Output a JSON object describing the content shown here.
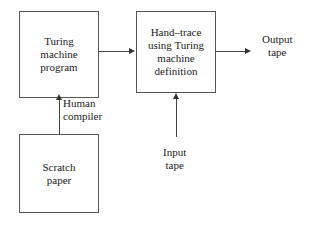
{
  "diagram": {
    "background_color": "#ffffff",
    "line_color": "#444444",
    "text_color": "#222222",
    "boxes": [
      {
        "id": "turing-machine-program",
        "lines": [
          "Turing",
          "machine",
          "program"
        ]
      },
      {
        "id": "hand-trace",
        "lines": [
          "Hand–trace",
          "using Turing",
          "machine",
          "definition"
        ]
      },
      {
        "id": "scratch-paper",
        "lines": [
          "Scratch",
          "paper"
        ]
      }
    ],
    "labels": [
      {
        "id": "human-compiler",
        "lines": [
          "Human",
          "compiler"
        ]
      },
      {
        "id": "input-tape",
        "lines": [
          "Input",
          "tape"
        ]
      },
      {
        "id": "output-tape",
        "lines": [
          "Output",
          "tape"
        ]
      }
    ],
    "connectors": [
      {
        "id": "program-to-handtrace",
        "from": "turing-machine-program",
        "to": "hand-trace",
        "direction": "right"
      },
      {
        "id": "handtrace-to-output",
        "from": "hand-trace",
        "to": "output-tape",
        "direction": "right"
      },
      {
        "id": "scratch-to-program",
        "from": "scratch-paper",
        "to": "turing-machine-program",
        "direction": "up",
        "label": "human-compiler"
      },
      {
        "id": "inputtape-to-handtrace",
        "from": "input-tape",
        "to": "hand-trace",
        "direction": "up"
      }
    ]
  }
}
